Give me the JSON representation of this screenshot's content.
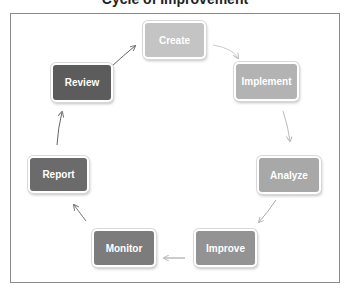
{
  "title": "Cycle of Improvement",
  "nodes": [
    {
      "label": "Create",
      "color": "#c4c4c4"
    },
    {
      "label": "Implement",
      "color": "#b3b3b3"
    },
    {
      "label": "Analyze",
      "color": "#a8a8a8"
    },
    {
      "label": "Improve",
      "color": "#939393"
    },
    {
      "label": "Monitor",
      "color": "#7c7c7c"
    },
    {
      "label": "Report",
      "color": "#6b6b6b"
    },
    {
      "label": "Review",
      "color": "#5c5c5c"
    }
  ],
  "edges": [
    {
      "from": "Create",
      "to": "Implement"
    },
    {
      "from": "Implement",
      "to": "Analyze"
    },
    {
      "from": "Analyze",
      "to": "Improve"
    },
    {
      "from": "Improve",
      "to": "Monitor"
    },
    {
      "from": "Monitor",
      "to": "Report"
    },
    {
      "from": "Report",
      "to": "Review"
    },
    {
      "from": "Review",
      "to": "Create"
    }
  ]
}
